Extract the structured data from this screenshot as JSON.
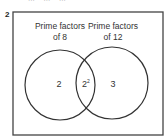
{
  "question": {
    "number": "2",
    "cut_off_text": "...    ...    ..."
  },
  "venn": {
    "sets": [
      {
        "label_line1": "Prime factors",
        "label_line2": "of 8",
        "only_value": "2"
      },
      {
        "label_line1": "Prime factors",
        "label_line2": "of 12",
        "only_value": "3"
      }
    ],
    "intersection": {
      "base": "2",
      "exponent": "2"
    },
    "colors": {
      "stroke": "#333333",
      "background": "#ffffff"
    }
  }
}
